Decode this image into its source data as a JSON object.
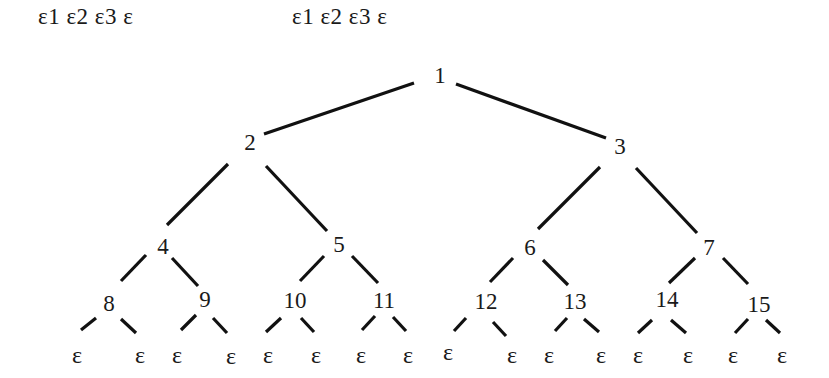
{
  "header": {
    "sequence_left": "ε1 ε2 ε3 ε",
    "sequence_right": "ε1 ε2 ε3 ε"
  },
  "tree": {
    "type": "complete-binary-tree",
    "leaf_symbol": "ε",
    "nodes": [
      {
        "id": "1",
        "label": "1",
        "x": 440,
        "y": 75
      },
      {
        "id": "2",
        "label": "2",
        "x": 250,
        "y": 142
      },
      {
        "id": "3",
        "label": "3",
        "x": 620,
        "y": 146
      },
      {
        "id": "4",
        "label": "4",
        "x": 163,
        "y": 246
      },
      {
        "id": "5",
        "label": "5",
        "x": 339,
        "y": 244
      },
      {
        "id": "6",
        "label": "6",
        "x": 530,
        "y": 247
      },
      {
        "id": "7",
        "label": "7",
        "x": 709,
        "y": 247
      },
      {
        "id": "8",
        "label": "8",
        "x": 109,
        "y": 303
      },
      {
        "id": "9",
        "label": "9",
        "x": 205,
        "y": 299
      },
      {
        "id": "10",
        "label": "10",
        "x": 295,
        "y": 300
      },
      {
        "id": "11",
        "label": "11",
        "x": 384,
        "y": 300
      },
      {
        "id": "12",
        "label": "12",
        "x": 486,
        "y": 301
      },
      {
        "id": "13",
        "label": "13",
        "x": 575,
        "y": 301
      },
      {
        "id": "14",
        "label": "14",
        "x": 667,
        "y": 299
      },
      {
        "id": "15",
        "label": "15",
        "x": 759,
        "y": 304
      }
    ],
    "leaves": [
      {
        "parent": "8",
        "label": "ε",
        "x": 77,
        "y": 355
      },
      {
        "parent": "8",
        "label": "ε",
        "x": 140,
        "y": 355
      },
      {
        "parent": "9",
        "label": "ε",
        "x": 177,
        "y": 355
      },
      {
        "parent": "9",
        "label": "ε",
        "x": 231,
        "y": 356
      },
      {
        "parent": "10",
        "label": "ε",
        "x": 268,
        "y": 355
      },
      {
        "parent": "10",
        "label": "ε",
        "x": 316,
        "y": 355
      },
      {
        "parent": "11",
        "label": "ε",
        "x": 361,
        "y": 355
      },
      {
        "parent": "11",
        "label": "ε",
        "x": 408,
        "y": 355
      },
      {
        "parent": "12",
        "label": "ε",
        "x": 448,
        "y": 352
      },
      {
        "parent": "12",
        "label": "ε",
        "x": 512,
        "y": 355
      },
      {
        "parent": "13",
        "label": "ε",
        "x": 549,
        "y": 355
      },
      {
        "parent": "13",
        "label": "ε",
        "x": 601,
        "y": 355
      },
      {
        "parent": "14",
        "label": "ε",
        "x": 638,
        "y": 355
      },
      {
        "parent": "14",
        "label": "ε",
        "x": 688,
        "y": 355
      },
      {
        "parent": "15",
        "label": "ε",
        "x": 733,
        "y": 355
      },
      {
        "parent": "15",
        "label": "ε",
        "x": 782,
        "y": 355
      }
    ],
    "edges": [
      {
        "from": "1",
        "to": "2",
        "x1": 414,
        "y1": 83,
        "x2": 264,
        "y2": 134
      },
      {
        "from": "1",
        "to": "3",
        "x1": 456,
        "y1": 84,
        "x2": 606,
        "y2": 138
      },
      {
        "from": "2",
        "to": "4",
        "x1": 228,
        "y1": 164,
        "x2": 167,
        "y2": 225
      },
      {
        "from": "2",
        "to": "5",
        "x1": 266,
        "y1": 166,
        "x2": 327,
        "y2": 231
      },
      {
        "from": "3",
        "to": "6",
        "x1": 600,
        "y1": 167,
        "x2": 538,
        "y2": 229
      },
      {
        "from": "3",
        "to": "7",
        "x1": 636,
        "y1": 168,
        "x2": 697,
        "y2": 233
      },
      {
        "from": "4",
        "to": "8",
        "x1": 146,
        "y1": 255,
        "x2": 121,
        "y2": 281
      },
      {
        "from": "4",
        "to": "9",
        "x1": 172,
        "y1": 258,
        "x2": 198,
        "y2": 286
      },
      {
        "from": "5",
        "to": "10",
        "x1": 324,
        "y1": 256,
        "x2": 300,
        "y2": 281
      },
      {
        "from": "5",
        "to": "11",
        "x1": 352,
        "y1": 256,
        "x2": 378,
        "y2": 283
      },
      {
        "from": "6",
        "to": "12",
        "x1": 513,
        "y1": 258,
        "x2": 490,
        "y2": 282
      },
      {
        "from": "6",
        "to": "13",
        "x1": 543,
        "y1": 260,
        "x2": 568,
        "y2": 285
      },
      {
        "from": "7",
        "to": "14",
        "x1": 695,
        "y1": 258,
        "x2": 669,
        "y2": 283
      },
      {
        "from": "7",
        "to": "15",
        "x1": 723,
        "y1": 258,
        "x2": 748,
        "y2": 284
      },
      {
        "from": "8",
        "to": "leaf",
        "x1": 96,
        "y1": 318,
        "x2": 81,
        "y2": 330
      },
      {
        "from": "8",
        "to": "leaf",
        "x1": 121,
        "y1": 319,
        "x2": 136,
        "y2": 333
      },
      {
        "from": "9",
        "to": "leaf",
        "x1": 196,
        "y1": 315,
        "x2": 181,
        "y2": 330
      },
      {
        "from": "9",
        "to": "leaf",
        "x1": 213,
        "y1": 318,
        "x2": 227,
        "y2": 333
      },
      {
        "from": "10",
        "to": "leaf",
        "x1": 281,
        "y1": 318,
        "x2": 266,
        "y2": 332
      },
      {
        "from": "10",
        "to": "leaf",
        "x1": 301,
        "y1": 318,
        "x2": 314,
        "y2": 332
      },
      {
        "from": "11",
        "to": "leaf",
        "x1": 375,
        "y1": 316,
        "x2": 362,
        "y2": 330
      },
      {
        "from": "11",
        "to": "leaf",
        "x1": 393,
        "y1": 317,
        "x2": 406,
        "y2": 331
      },
      {
        "from": "12",
        "to": "leaf",
        "x1": 466,
        "y1": 318,
        "x2": 454,
        "y2": 331
      },
      {
        "from": "12",
        "to": "leaf",
        "x1": 493,
        "y1": 322,
        "x2": 506,
        "y2": 336
      },
      {
        "from": "13",
        "to": "leaf",
        "x1": 567,
        "y1": 318,
        "x2": 555,
        "y2": 331
      },
      {
        "from": "13",
        "to": "leaf",
        "x1": 584,
        "y1": 319,
        "x2": 599,
        "y2": 332
      },
      {
        "from": "14",
        "to": "leaf",
        "x1": 652,
        "y1": 320,
        "x2": 638,
        "y2": 333
      },
      {
        "from": "14",
        "to": "leaf",
        "x1": 671,
        "y1": 320,
        "x2": 686,
        "y2": 333
      },
      {
        "from": "15",
        "to": "leaf",
        "x1": 748,
        "y1": 319,
        "x2": 735,
        "y2": 333
      },
      {
        "from": "15",
        "to": "leaf",
        "x1": 766,
        "y1": 320,
        "x2": 780,
        "y2": 333
      }
    ]
  }
}
